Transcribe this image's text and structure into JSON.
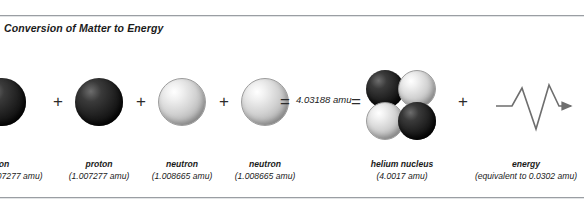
{
  "figure": {
    "title": "Conversion of Matter to Energy",
    "operators": {
      "plus": "+",
      "equals": "="
    },
    "mass_sum": "4.03188 amu",
    "reactants": [
      {
        "particle": "proton",
        "name": "proton",
        "mass": "(1.007277 amu)",
        "name_clipped": "proton",
        "mass_clipped": "07277 amu)",
        "shade": "dark"
      },
      {
        "particle": "proton",
        "name": "proton",
        "mass": "(1.007277 amu)",
        "shade": "dark"
      },
      {
        "particle": "neutron",
        "name": "neutron",
        "mass": "(1.008665 amu)",
        "shade": "light"
      },
      {
        "particle": "neutron",
        "name": "neutron",
        "mass": "(1.008665 amu)",
        "shade": "light"
      }
    ],
    "products": [
      {
        "particle": "helium-nucleus",
        "name": "helium nucleus",
        "mass": "(4.0017 amu)"
      },
      {
        "particle": "energy",
        "name": "energy",
        "mass": "(equivalent to 0.0302 amu)"
      }
    ],
    "colors": {
      "proton_sphere": "#1d1d1d",
      "neutron_sphere": "#d2d2d2",
      "rule": "#9a9ea3",
      "text": "#1b1b1b",
      "wave_stroke": "#6e6e6e"
    }
  }
}
